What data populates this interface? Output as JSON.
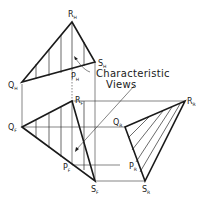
{
  "annotation": {
    "line1": "Characteristic",
    "line2": "Views"
  },
  "labels": {
    "RH": {
      "main": "R",
      "sub": "H"
    },
    "QH": {
      "main": "Q",
      "sub": "H"
    },
    "SH": {
      "main": "S",
      "sub": "H"
    },
    "PH": {
      "main": "P",
      "sub": "H"
    },
    "RF": {
      "main": "R",
      "sub": "F"
    },
    "QF": {
      "main": "Q",
      "sub": "F"
    },
    "SF": {
      "main": "S",
      "sub": "F"
    },
    "PF": {
      "main": "P",
      "sub": "F"
    },
    "RR": {
      "main": "R",
      "sub": "R"
    },
    "QR": {
      "main": "Q",
      "sub": "R"
    },
    "SR": {
      "main": "S",
      "sub": "R"
    },
    "PR": {
      "main": "P",
      "sub": "R"
    }
  },
  "views": [
    {
      "name": "top-view",
      "vertices": [
        "Q_H",
        "R_H",
        "S_H"
      ],
      "hatching": "vertical"
    },
    {
      "name": "front-view",
      "vertices": [
        "Q_F",
        "R_F",
        "S_F"
      ],
      "hatching": "vertical"
    },
    {
      "name": "right-side-view",
      "vertices": [
        "Q_R",
        "R_R",
        "S_R"
      ],
      "hatching": "diagonal"
    }
  ],
  "colors": {
    "line": "#1a1a1a",
    "background": "#ffffff"
  }
}
